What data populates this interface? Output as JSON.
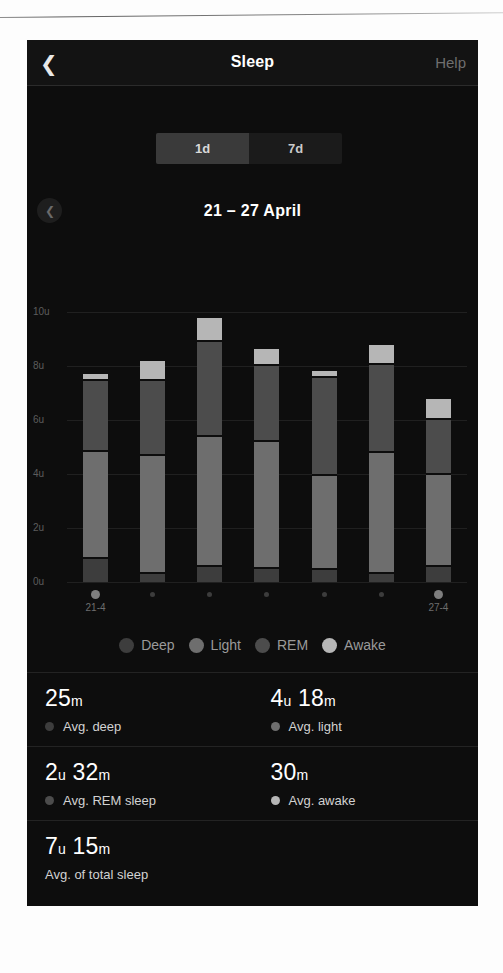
{
  "header": {
    "back_icon": "chevron-left-icon",
    "title": "Sleep",
    "help_label": "Help"
  },
  "range_selector": {
    "options": [
      {
        "label": "1d",
        "selected": true
      },
      {
        "label": "7d",
        "selected": false
      }
    ]
  },
  "week_selector": {
    "prev_icon": "chevron-left-icon",
    "label": "21 – 27 April"
  },
  "legend": [
    {
      "label": "Deep",
      "color": "#3d3d3d"
    },
    {
      "label": "Light",
      "color": "#6e6e6e"
    },
    {
      "label": "REM",
      "color": "#4c4c4c"
    },
    {
      "label": "Awake",
      "color": "#b6b6b6"
    }
  ],
  "stats": [
    {
      "value": "25",
      "unit1": "m",
      "value2": "",
      "unit2": "",
      "label": "Avg. deep",
      "dot": "#3d3d3d",
      "show_dot": true
    },
    {
      "value": "4",
      "unit1": "u",
      "value2": "18",
      "unit2": "m",
      "label": "Avg. light",
      "dot": "#6e6e6e",
      "show_dot": true
    },
    {
      "value": "2",
      "unit1": "u",
      "value2": "32",
      "unit2": "m",
      "label": "Avg. REM sleep",
      "dot": "#4c4c4c",
      "show_dot": true
    },
    {
      "value": "30",
      "unit1": "m",
      "value2": "",
      "unit2": "",
      "label": "Avg. awake",
      "dot": "#b6b6b6",
      "show_dot": true
    },
    {
      "value": "7",
      "unit1": "u",
      "value2": "15",
      "unit2": "m",
      "label": "Avg. of total sleep",
      "dot": "",
      "show_dot": false
    }
  ],
  "chart_data": {
    "type": "bar",
    "title": "",
    "xlabel": "",
    "ylabel": "",
    "stacked": true,
    "grid": true,
    "legend_position": "bottom",
    "ylim": [
      0,
      10
    ],
    "yticks": [
      10,
      8,
      6,
      4,
      2,
      0
    ],
    "ytick_labels": [
      "10u",
      "8u",
      "6u",
      "4u",
      "2u",
      "0u"
    ],
    "categories": [
      "21-4",
      "22-4",
      "23-4",
      "24-4",
      "25-4",
      "26-4",
      "27-4"
    ],
    "tick_labels_shown": [
      "21-4",
      "",
      "",
      "",
      "",
      "",
      "27-4"
    ],
    "series": [
      {
        "name": "Deep",
        "color": "#3d3d3d",
        "values": [
          0.85,
          0.3,
          0.55,
          0.5,
          0.45,
          0.3,
          0.55
        ]
      },
      {
        "name": "Light",
        "color": "#6e6e6e",
        "values": [
          3.9,
          4.3,
          4.75,
          4.6,
          3.4,
          4.4,
          3.35
        ]
      },
      {
        "name": "REM",
        "color": "#4c4c4c",
        "values": [
          2.55,
          2.7,
          3.45,
          2.75,
          3.55,
          3.2,
          1.95
        ]
      },
      {
        "name": "Awake",
        "color": "#b6b6b6",
        "values": [
          0.2,
          0.65,
          0.8,
          0.55,
          0.2,
          0.65,
          0.7
        ]
      }
    ]
  }
}
